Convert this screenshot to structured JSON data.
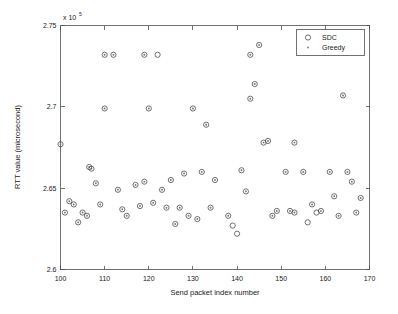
{
  "figure": {
    "background_color": "#ffffff",
    "axis_color": "#4d4d4d",
    "marker_color": "#555555"
  },
  "chart_data": {
    "type": "scatter",
    "title": "",
    "xlabel": "Send packet index number",
    "ylabel": "RTT value (microsecond)",
    "xlim": [
      100,
      170
    ],
    "ylim": [
      260000,
      275000
    ],
    "xticks": [
      100,
      110,
      120,
      130,
      140,
      150,
      160,
      170
    ],
    "xticklabels": [
      "100",
      "110",
      "120",
      "130",
      "140",
      "150",
      "160",
      "170"
    ],
    "yticks": [
      260000,
      265000,
      270000,
      275000
    ],
    "yticklabels": [
      "2.6",
      "2.65",
      "2.7",
      "2.75"
    ],
    "y_axis_multiplier_mantissa": "x 10",
    "y_axis_multiplier_exponent": "5",
    "grid": false,
    "legend_position": "upper right",
    "series": [
      {
        "name": "SDC",
        "marker": "circle-open",
        "points": [
          [
            100,
            267700
          ],
          [
            101,
            263500
          ],
          [
            102,
            264200
          ],
          [
            103,
            264000
          ],
          [
            104,
            262900
          ],
          [
            105,
            263500
          ],
          [
            106,
            263300
          ],
          [
            106.5,
            266300
          ],
          [
            107,
            266200
          ],
          [
            108,
            265300
          ],
          [
            109,
            264000
          ],
          [
            110,
            273200
          ],
          [
            110,
            269900
          ],
          [
            112,
            273200
          ],
          [
            113,
            264900
          ],
          [
            114,
            263700
          ],
          [
            115,
            263300
          ],
          [
            117,
            265200
          ],
          [
            118,
            263900
          ],
          [
            119,
            265400
          ],
          [
            119,
            273200
          ],
          [
            120,
            269900
          ],
          [
            121,
            264100
          ],
          [
            122,
            273200
          ],
          [
            123,
            264900
          ],
          [
            124,
            263800
          ],
          [
            125,
            265500
          ],
          [
            126,
            262800
          ],
          [
            127,
            263800
          ],
          [
            128,
            265900
          ],
          [
            129,
            263300
          ],
          [
            130,
            269900
          ],
          [
            131,
            263100
          ],
          [
            132,
            266000
          ],
          [
            133,
            268900
          ],
          [
            134,
            263800
          ],
          [
            135,
            265500
          ],
          [
            138,
            263300
          ],
          [
            139,
            262700
          ],
          [
            140,
            262200
          ],
          [
            141,
            266100
          ],
          [
            142,
            264800
          ],
          [
            143,
            273200
          ],
          [
            143,
            270500
          ],
          [
            144,
            271400
          ],
          [
            145,
            273800
          ],
          [
            146,
            267800
          ],
          [
            147,
            267900
          ],
          [
            148,
            263300
          ],
          [
            149,
            263600
          ],
          [
            151,
            266000
          ],
          [
            152,
            263600
          ],
          [
            153,
            267800
          ],
          [
            153,
            263500
          ],
          [
            155,
            266000
          ],
          [
            156,
            262900
          ],
          [
            157,
            264000
          ],
          [
            158,
            263500
          ],
          [
            159,
            263600
          ],
          [
            161,
            266000
          ],
          [
            162,
            264500
          ],
          [
            163,
            263300
          ],
          [
            164,
            270700
          ],
          [
            165,
            266000
          ],
          [
            166,
            265400
          ],
          [
            167,
            263500
          ],
          [
            168,
            264400
          ]
        ]
      },
      {
        "name": "Greedy",
        "marker": "point",
        "points": [
          [
            100,
            267700
          ],
          [
            101,
            263500
          ],
          [
            102,
            264200
          ],
          [
            103,
            264000
          ],
          [
            104,
            262900
          ],
          [
            105,
            263500
          ],
          [
            106,
            263300
          ],
          [
            106.5,
            266300
          ],
          [
            107,
            266200
          ],
          [
            108,
            265300
          ],
          [
            109,
            264000
          ],
          [
            110,
            273200
          ],
          [
            110,
            269900
          ],
          [
            112,
            273200
          ],
          [
            113,
            264900
          ],
          [
            114,
            263700
          ],
          [
            115,
            263300
          ],
          [
            117,
            265200
          ],
          [
            118,
            263900
          ],
          [
            119,
            265400
          ],
          [
            119,
            273200
          ],
          [
            120,
            269900
          ],
          [
            121,
            264100
          ],
          [
            123,
            264900
          ],
          [
            124,
            263800
          ],
          [
            125,
            265500
          ],
          [
            126,
            262800
          ],
          [
            127,
            263800
          ],
          [
            128,
            265900
          ],
          [
            129,
            263300
          ],
          [
            130,
            269900
          ],
          [
            131,
            263100
          ],
          [
            132,
            266000
          ],
          [
            133,
            268900
          ],
          [
            134,
            263800
          ],
          [
            135,
            265500
          ],
          [
            138,
            263300
          ],
          [
            141,
            266100
          ],
          [
            142,
            264800
          ],
          [
            143,
            273200
          ],
          [
            143,
            270500
          ],
          [
            144,
            271400
          ],
          [
            145,
            273800
          ],
          [
            146,
            267800
          ],
          [
            147,
            267900
          ],
          [
            148,
            263300
          ],
          [
            149,
            263600
          ],
          [
            151,
            266000
          ],
          [
            152,
            263600
          ],
          [
            153,
            267800
          ],
          [
            153,
            263500
          ],
          [
            155,
            266000
          ],
          [
            157,
            264000
          ],
          [
            159,
            263600
          ],
          [
            161,
            266000
          ],
          [
            162,
            264500
          ],
          [
            163,
            263300
          ],
          [
            164,
            270700
          ],
          [
            165,
            266000
          ],
          [
            166,
            265400
          ],
          [
            167,
            263500
          ],
          [
            168,
            264400
          ]
        ]
      }
    ],
    "legend": [
      {
        "label": "SDC",
        "marker": "circle-open"
      },
      {
        "label": "Greedy",
        "marker": "point"
      }
    ]
  }
}
